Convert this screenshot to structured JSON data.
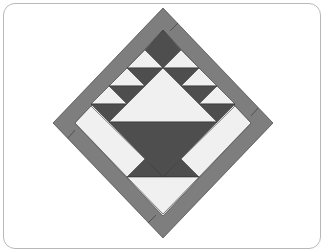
{
  "figure": {
    "colors": {
      "border": "#7e7e7e",
      "dark": "#4e4e4e",
      "light": "#f0f0f0",
      "outline": "#333333",
      "frame": "#b8b8b8"
    },
    "geometry": {
      "top": [
        163,
        8
      ],
      "right": [
        273,
        123
      ],
      "bottom": [
        163,
        238
      ],
      "left": [
        53,
        123
      ]
    }
  }
}
